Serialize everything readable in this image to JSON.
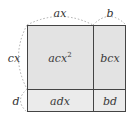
{
  "diagram": {
    "type": "area-model",
    "top_labels": {
      "left": "ax",
      "right": "b"
    },
    "side_labels": {
      "top": "cx",
      "bottom": "d"
    },
    "cells": {
      "top_left": {
        "base": "acx",
        "exponent": "2"
      },
      "top_right": "bcx",
      "bottom_left": "adx",
      "bottom_right": "bd"
    },
    "colors": {
      "cell_fill": "#e6e6e6",
      "border": "#444444",
      "brace": "#aaaaaa",
      "text": "#333333"
    }
  }
}
